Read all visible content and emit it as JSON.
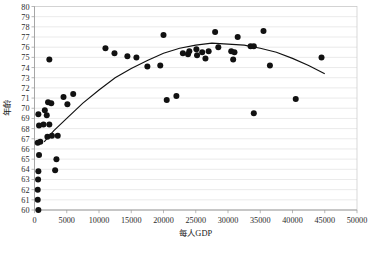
{
  "chart_data": {
    "type": "scatter",
    "title": "",
    "xlabel": "每人GDP",
    "ylabel": "年齡",
    "xlim": [
      0,
      50000
    ],
    "ylim": [
      60,
      80
    ],
    "xticks": [
      0,
      5000,
      10000,
      15000,
      20000,
      25000,
      30000,
      35000,
      40000,
      45000,
      50000
    ],
    "yticks": [
      60,
      61,
      62,
      63,
      64,
      65,
      66,
      67,
      68,
      69,
      70,
      71,
      72,
      73,
      74,
      75,
      76,
      77,
      78,
      79,
      80
    ],
    "xtick_labels": [
      "0",
      "5000",
      "10000",
      "15000",
      "20000",
      "25000",
      "30000",
      "35000",
      "40000",
      "45000",
      "50000"
    ],
    "ytick_labels": [
      "60",
      "61",
      "62",
      "63",
      "64",
      "65",
      "66",
      "67",
      "68",
      "69",
      "70",
      "71",
      "72",
      "73",
      "74",
      "75",
      "76",
      "77",
      "78",
      "79",
      "80"
    ],
    "grid": true,
    "grid_axis": "y",
    "legend": false,
    "marker_color": "#111111",
    "marker_size": 3.0,
    "trendline": {
      "present": true,
      "type": "quadratic",
      "color": "#111111",
      "x_start": 1500,
      "x_end": 45000,
      "description": "Concave-down quadratic fit peaking near 28000 GDP at about 76.3 years",
      "coefficients": {
        "a": -1.33e-08,
        "b": 0.000755,
        "c": 65.6
      },
      "points": [
        [
          1500,
          66.7
        ],
        [
          3000,
          67.8
        ],
        [
          5000,
          69.0
        ],
        [
          7500,
          70.5
        ],
        [
          10000,
          71.8
        ],
        [
          12500,
          73.0
        ],
        [
          15000,
          73.9
        ],
        [
          17500,
          74.7
        ],
        [
          20000,
          75.4
        ],
        [
          22500,
          75.9
        ],
        [
          25000,
          76.2
        ],
        [
          27500,
          76.4
        ],
        [
          30000,
          76.3
        ],
        [
          32500,
          76.2
        ],
        [
          35000,
          75.9
        ],
        [
          37500,
          75.5
        ],
        [
          40000,
          74.9
        ],
        [
          42500,
          74.2
        ],
        [
          45000,
          73.4
        ]
      ]
    },
    "series": [
      {
        "name": "Countries",
        "points": [
          [
            600,
            60.0
          ],
          [
            500,
            61.0
          ],
          [
            500,
            62.0
          ],
          [
            550,
            63.0
          ],
          [
            600,
            63.8
          ],
          [
            3200,
            63.9
          ],
          [
            3400,
            65.0
          ],
          [
            700,
            65.4
          ],
          [
            500,
            66.6
          ],
          [
            900,
            66.7
          ],
          [
            2000,
            67.2
          ],
          [
            2700,
            67.3
          ],
          [
            3600,
            67.3
          ],
          [
            700,
            68.3
          ],
          [
            1400,
            68.4
          ],
          [
            2300,
            68.4
          ],
          [
            1900,
            69.3
          ],
          [
            600,
            69.4
          ],
          [
            1600,
            69.8
          ],
          [
            34000,
            69.5
          ],
          [
            2100,
            70.6
          ],
          [
            2600,
            70.5
          ],
          [
            5100,
            70.4
          ],
          [
            4500,
            71.1
          ],
          [
            6000,
            71.4
          ],
          [
            20500,
            70.8
          ],
          [
            22000,
            71.2
          ],
          [
            17500,
            74.1
          ],
          [
            19500,
            74.2
          ],
          [
            2300,
            74.8
          ],
          [
            14400,
            75.1
          ],
          [
            12400,
            75.4
          ],
          [
            15800,
            75.0
          ],
          [
            11000,
            75.9
          ],
          [
            23000,
            75.4
          ],
          [
            23800,
            75.3
          ],
          [
            24000,
            75.6
          ],
          [
            25200,
            75.2
          ],
          [
            25100,
            75.8
          ],
          [
            26000,
            75.5
          ],
          [
            26500,
            74.9
          ],
          [
            27000,
            75.6
          ],
          [
            28500,
            76.0
          ],
          [
            30500,
            75.6
          ],
          [
            31000,
            75.5
          ],
          [
            30800,
            74.8
          ],
          [
            33500,
            76.1
          ],
          [
            34000,
            76.1
          ],
          [
            31500,
            77.0
          ],
          [
            20000,
            77.2
          ],
          [
            28000,
            77.5
          ],
          [
            35500,
            77.6
          ],
          [
            36500,
            74.2
          ],
          [
            40500,
            70.9
          ],
          [
            44500,
            75.0
          ]
        ]
      }
    ]
  }
}
